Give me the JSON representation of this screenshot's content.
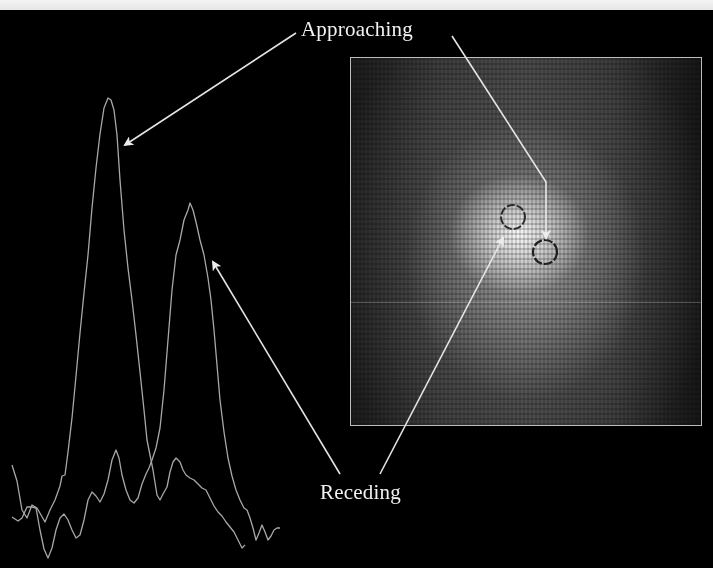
{
  "figure": {
    "labels": {
      "approaching": "Approaching",
      "receding": "Receding"
    },
    "colors": {
      "background": "#000000",
      "top_band": "#eeeeee",
      "spectrum_line": "#a8a8a8",
      "arrow": "#e8e8e8",
      "label_text": "#f2f2f2",
      "panel_border": "#bdbdbd",
      "circle_marker": "#2a2a2a"
    },
    "spectrum_panel": {
      "description": "Two emission-line spectra, approaching peak (left, taller) and receding peak (right)",
      "series": [
        {
          "name": "approaching-spectrum",
          "peak_x": 108,
          "peak_y": 98
        },
        {
          "name": "receding-spectrum",
          "peak_x": 190,
          "peak_y": 203
        }
      ]
    },
    "image_panel": {
      "description": "Pixelated grayscale image of a bright central source with two circled positions",
      "markers": [
        {
          "name": "receding-circle",
          "cx": 513,
          "cy": 217,
          "r": 12
        },
        {
          "name": "approaching-circle",
          "cx": 545,
          "cy": 252,
          "r": 12
        }
      ]
    },
    "arrows": [
      {
        "name": "approaching-to-spectrum-arrow",
        "from_label": "approaching",
        "target": "approaching-spectrum peak"
      },
      {
        "name": "approaching-to-image-arrow",
        "from_label": "approaching",
        "target": "approaching-circle"
      },
      {
        "name": "receding-to-spectrum-arrow",
        "from_label": "receding",
        "target": "receding-spectrum peak"
      },
      {
        "name": "receding-to-image-arrow",
        "from_label": "receding",
        "target": "receding-circle"
      }
    ]
  }
}
